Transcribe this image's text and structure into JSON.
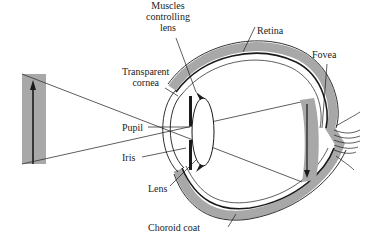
{
  "diagram": {
    "labels": {
      "muscles_line1": "Muscles",
      "muscles_line2": "controlling",
      "muscles_line3": "lens",
      "retina": "Retina",
      "fovea": "Fovea",
      "cornea_line1": "Transparent",
      "cornea_line2": "cornea",
      "pupil": "Pupil",
      "iris": "Iris",
      "lens": "Lens",
      "choroid": "Choroid coat"
    },
    "colors": {
      "tissue_gray": "#a8a8a8",
      "line": "#1a1a1a",
      "background": "#ffffff"
    }
  }
}
